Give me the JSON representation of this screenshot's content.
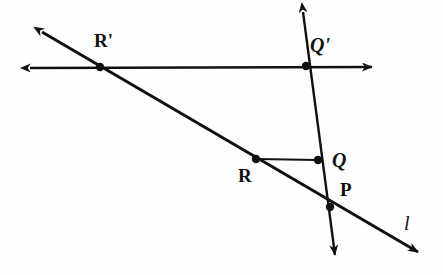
{
  "figure": {
    "background_color": "#fefefe",
    "stroke_color": "#111111",
    "width": 443,
    "height": 275
  },
  "labels": {
    "r_prime": "R'",
    "q_prime": "Q'",
    "q": "Q",
    "p": "P",
    "r": "R",
    "line_l": "l"
  },
  "chart_data": {
    "type": "diagram",
    "xlabel": "",
    "ylabel": "",
    "xlim": [
      0,
      443
    ],
    "ylim": [
      275,
      0
    ],
    "grid": false,
    "legend": null,
    "points": [
      {
        "name": "R'",
        "x": 100,
        "y": 67,
        "marker": "filled-dot",
        "label_dx": -6,
        "label_dy": -36
      },
      {
        "name": "Q'",
        "x": 306,
        "y": 66,
        "marker": "filled-dot",
        "label_dx": 4,
        "label_dy": -31
      },
      {
        "name": "R",
        "x": 256,
        "y": 159,
        "marker": "filled-dot",
        "label_dx": -18,
        "label_dy": 7
      },
      {
        "name": "Q",
        "x": 318,
        "y": 160,
        "marker": "filled-dot",
        "label_dx": 14,
        "label_dy": -10
      },
      {
        "name": "P",
        "x": 330,
        "y": 207,
        "marker": "filled-dot",
        "label_dx": 10,
        "label_dy": -27
      }
    ],
    "segments": [
      {
        "name": "horizontal-line-through-Rprime-Qprime",
        "x1": 30,
        "y1": 68,
        "x2": 372,
        "y2": 67,
        "arrow_start": true,
        "arrow_end": true,
        "width": 2.4
      },
      {
        "name": "line-l-through-Rprime-R-P",
        "x1": 42,
        "y1": 32,
        "x2": 418,
        "y2": 252,
        "arrow_start": true,
        "arrow_end": true,
        "width": 3.0
      },
      {
        "name": "transversal-through-Qprime-Q-P",
        "x1": 303,
        "y1": 12,
        "x2": 335,
        "y2": 255,
        "arrow_start": true,
        "arrow_end": true,
        "width": 2.4
      },
      {
        "name": "segment-R-to-Q",
        "x1": 256,
        "y1": 159,
        "x2": 318,
        "y2": 160,
        "arrow_start": false,
        "arrow_end": false,
        "width": 2.0
      }
    ],
    "line_labels": [
      {
        "text": "l",
        "x": 408,
        "y": 225
      }
    ]
  }
}
